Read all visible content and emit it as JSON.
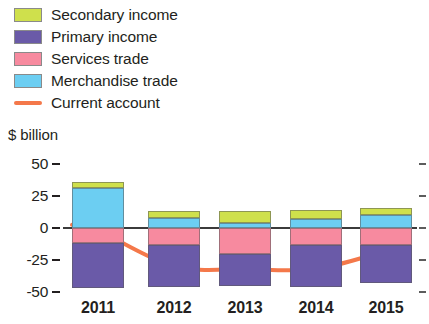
{
  "chart_data": {
    "type": "bar",
    "subtype": "stacked-bar-with-line-overlay",
    "title": "",
    "xlabel": "",
    "ylabel": "$ billion",
    "ylim": [
      -50,
      50
    ],
    "yticks": [
      50,
      25,
      0,
      -25,
      -50
    ],
    "ytick_labels": [
      "50",
      "25",
      "0",
      "-25",
      "-50"
    ],
    "grid": false,
    "legend_position": "top-left",
    "categories": [
      "2011",
      "2012",
      "2013",
      "2014",
      "2015"
    ],
    "stacked": true,
    "series": [
      {
        "name": "Secondary income",
        "color": "#cfe04c",
        "values": [
          5,
          5,
          9,
          7,
          6
        ]
      },
      {
        "name": "Primary income",
        "color": "#6a5aa8",
        "values": [
          -35,
          -33,
          -25,
          -33,
          -30
        ]
      },
      {
        "name": "Services trade",
        "color": "#f78a9f",
        "values": [
          -12,
          -13,
          -20,
          -13,
          -13
        ]
      },
      {
        "name": "Merchandise trade",
        "color": "#6ccef2",
        "values": [
          31,
          8,
          4,
          7,
          10
        ]
      }
    ],
    "line_series": {
      "name": "Current account",
      "color": "#f4784a",
      "x": [
        "2011",
        "2012",
        "2013",
        "2014",
        "2015"
      ],
      "values": [
        -2,
        -30,
        -32,
        -32,
        -18
      ]
    }
  },
  "legend": {
    "items": [
      {
        "label": "Secondary income",
        "color": "#cfe04c",
        "marker": "swatch"
      },
      {
        "label": "Primary income",
        "color": "#6a5aa8",
        "marker": "swatch"
      },
      {
        "label": "Services trade",
        "color": "#f78a9f",
        "marker": "swatch"
      },
      {
        "label": "Merchandise trade",
        "color": "#6ccef2",
        "marker": "swatch"
      },
      {
        "label": "Current account",
        "color": "#f4784a",
        "marker": "line"
      }
    ]
  },
  "axes": {
    "y_axis_title": "$ billion",
    "y_tick_labels": [
      "50",
      "25",
      "0",
      "-25",
      "-50"
    ],
    "x_tick_labels": [
      "2011",
      "2012",
      "2013",
      "2014",
      "2015"
    ]
  },
  "colors": {
    "secondary_income": "#cfe04c",
    "primary_income": "#6a5aa8",
    "services_trade": "#f78a9f",
    "merchandise_trade": "#6ccef2",
    "current_account": "#f4784a",
    "zero_line": "#3b3b3b",
    "text": "#231f20"
  }
}
